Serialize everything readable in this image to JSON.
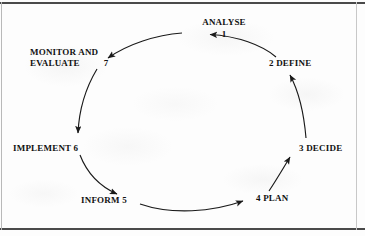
{
  "diagram": {
    "type": "cycle",
    "ink_color": "#111111",
    "background_color": "#fdfdfd",
    "border_color": "#4a4a4a",
    "nodes": [
      {
        "id": "analyse",
        "label": "ANALYSE",
        "number": "1",
        "number_position": "below"
      },
      {
        "id": "define",
        "label": "DEFINE",
        "number": "2",
        "number_position": "before"
      },
      {
        "id": "decide",
        "label": "DECIDE",
        "number": "3",
        "number_position": "before"
      },
      {
        "id": "plan",
        "label": "PLAN",
        "number": "4",
        "number_position": "before"
      },
      {
        "id": "inform",
        "label": "INFORM",
        "number": "5",
        "number_position": "after"
      },
      {
        "id": "implement",
        "label": "IMPLEMENT",
        "number": "6",
        "number_position": "after"
      },
      {
        "id": "monitor",
        "label_line1": "MONITOR AND",
        "label_line2": "EVALUATE",
        "number": "7",
        "number_position": "after"
      }
    ],
    "flow_order": [
      "analyse",
      "define",
      "decide",
      "plan",
      "inform",
      "implement",
      "monitor",
      "analyse"
    ],
    "arrow_count": 7,
    "direction": "counter-clockwise"
  }
}
